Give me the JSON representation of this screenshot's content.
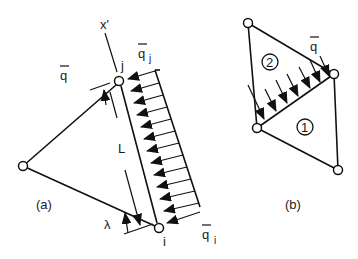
{
  "figure_a": {
    "label": "(a)",
    "axis_label": "x'",
    "length_label": "L",
    "coord_label": "λ",
    "load_label": "q",
    "load_j_label": "q",
    "load_j_sub": "j",
    "load_i_label": "q",
    "load_i_sub": "i",
    "node_j": "j",
    "node_i": "i"
  },
  "figure_b": {
    "label": "(b)",
    "load_label": "q",
    "element_1": "1",
    "element_2": "2"
  },
  "colors": {
    "stroke": "#111111",
    "background": "#ffffff"
  }
}
